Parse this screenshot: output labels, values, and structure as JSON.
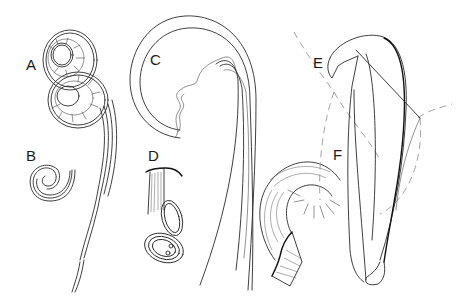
{
  "figure": {
    "panels": [
      {
        "id": "A",
        "label": "A",
        "description": "coiled double-spiral structure with long tapering stem"
      },
      {
        "id": "B",
        "label": "B",
        "description": "small tightly coiled spiral"
      },
      {
        "id": "C",
        "label": "C",
        "description": "large hooked curve with wavy inner membrane and long shafts"
      },
      {
        "id": "D",
        "label": "D",
        "description": "folded looped tube with capped top"
      },
      {
        "id": "E",
        "label": "E",
        "description": "hooked blade-like structure with dashed outline"
      },
      {
        "id": "F",
        "label": "F",
        "description": "hatched curled fibrous band with radiating fibers"
      }
    ],
    "colors": {
      "background": "#ffffff",
      "line": "#2a2a2a",
      "dashed_outline": "#9a9a9a"
    }
  }
}
